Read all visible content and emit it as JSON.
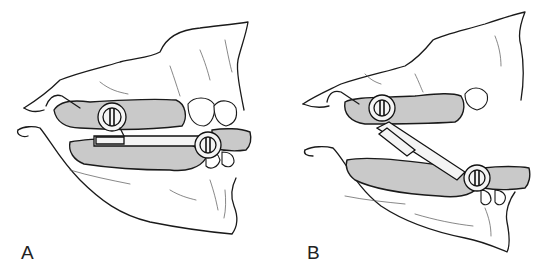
{
  "figure": {
    "panels": [
      {
        "id": "A",
        "label": "A",
        "state": "jaws closed, bar horizontal"
      },
      {
        "id": "B",
        "label": "B",
        "state": "jaws open, bar angled"
      }
    ],
    "colors": {
      "line": "#1a1a1a",
      "splint_fill": "#c9c9c9",
      "background": "#ffffff"
    }
  }
}
